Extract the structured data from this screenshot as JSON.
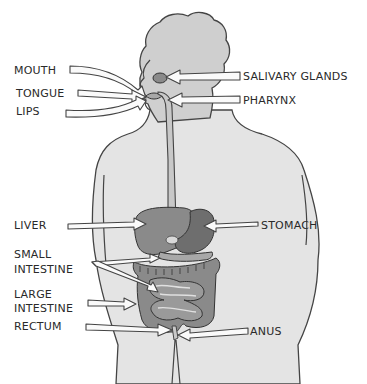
{
  "diagram": {
    "labels": {
      "mouth": "MOUTH",
      "tongue": "TONGUE",
      "lips": "LIPS",
      "salivary_glands": "SALIVARY GLANDS",
      "pharynx": "PHARYNX",
      "liver": "LIVER",
      "stomach": "STOMACH",
      "small_intestine_1": "SMALL",
      "small_intestine_2": "INTESTINE",
      "large_intestine_1": "LARGE",
      "large_intestine_2": "INTESTINE",
      "rectum": "RECTUM",
      "anus": "ANUS"
    },
    "colors": {
      "body": "#e4e4e4",
      "head": "#cfcfcf",
      "organ_dark": "#6e6e6e",
      "organ_mid": "#8a8a8a",
      "outline": "#444444"
    }
  }
}
